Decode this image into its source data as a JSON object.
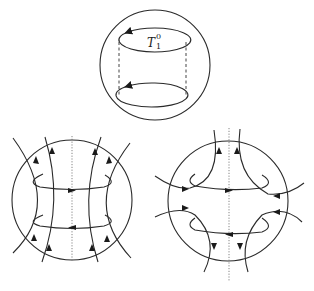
{
  "figure": {
    "top_panel": {
      "description": "Torus T_1^0 inside a ball, drawn as a cylinder with two oriented circles",
      "label": {
        "base": "T",
        "subscript": "1",
        "superscript": "0"
      }
    },
    "bottom_left_panel": {
      "description": "Ball with vertical flow lines diverging upward, two oriented horizontal circles, dotted vertical axis"
    },
    "bottom_right_panel": {
      "description": "Ball with saddle-type flow lines, two oriented horizontal circles, dotted vertical axis"
    },
    "colors": {
      "line": "#2a2a2a",
      "background": "#ffffff"
    }
  }
}
